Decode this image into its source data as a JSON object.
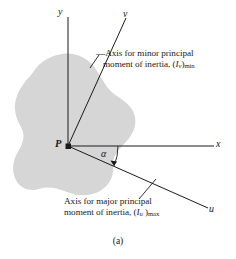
{
  "figure": {
    "caption": "(a)",
    "origin_label": "P",
    "angle_label": "α",
    "axes": [
      {
        "name": "y-axis",
        "label": "y"
      },
      {
        "name": "v-axis",
        "label": "v"
      },
      {
        "name": "x-axis",
        "label": "x"
      },
      {
        "name": "u-axis",
        "label": "u"
      }
    ],
    "callouts": {
      "minor": {
        "line1": "—Axis for minor principal",
        "line2_prefix": "moment of inertia, (",
        "line2_symbol": "I",
        "line2_symbol_sub": "v",
        "line2_mid": ")",
        "line2_sub": "min"
      },
      "major": {
        "line1": "Axis for major principal",
        "line2_prefix": "moment of inertia, (",
        "line2_symbol": "I",
        "line2_symbol_sub": "u",
        "line2_mid": " )",
        "line2_sub": "max"
      }
    },
    "colors": {
      "blob_fill": "#d6d6d6",
      "line": "#1a1a1a",
      "text": "#1a1a1a",
      "background": "#ffffff"
    }
  }
}
